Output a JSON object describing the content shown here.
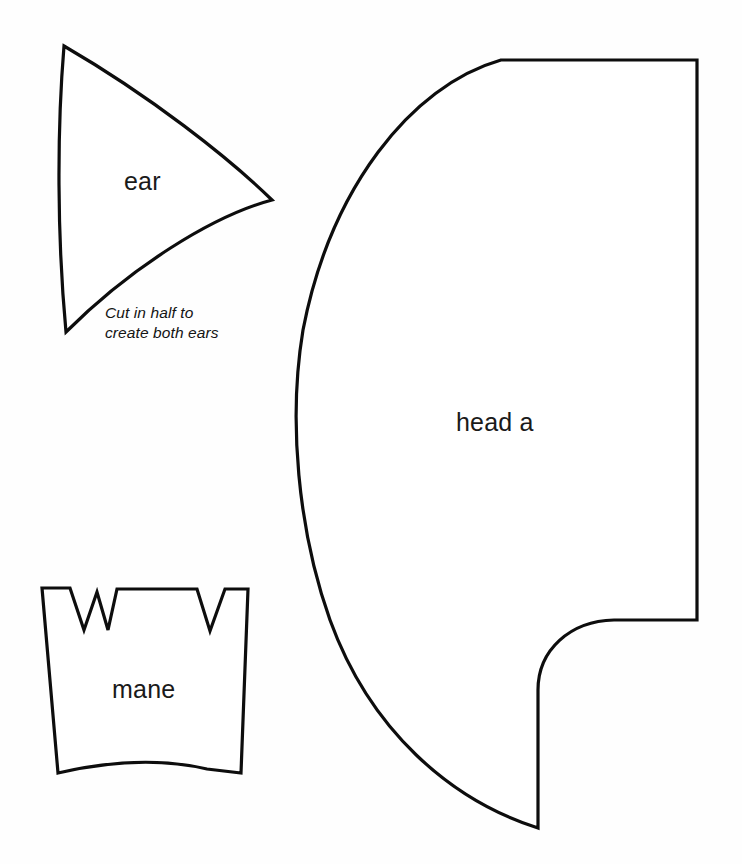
{
  "sheet": {
    "title": "Lion puppet pattern template sheet",
    "width": 742,
    "height": 864,
    "background_color": "#fefefe",
    "outline_color": "#0d0d0d",
    "fill_color": "#ffffff",
    "text_color": "#1a1a1a"
  },
  "pieces": [
    {
      "id": "ear",
      "label": "ear",
      "note": "Cut in half to\ncreate both ears",
      "shape": "curved-triangle"
    },
    {
      "id": "head-a",
      "label": "head a",
      "note": "",
      "shape": "quarter-round-with-notch"
    },
    {
      "id": "mane",
      "label": "mane",
      "note": "",
      "shape": "notched-trapezoid"
    }
  ],
  "labels": {
    "ear": "ear",
    "head_a": "head a",
    "mane": "mane"
  },
  "notes": {
    "cut_ears": "Cut in half to\ncreate both ears"
  }
}
